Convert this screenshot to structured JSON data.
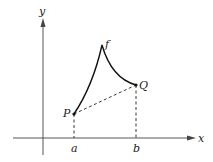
{
  "diagram": {
    "type": "function-curve-with-chord",
    "axes": {
      "x_label": "x",
      "y_label": "y"
    },
    "points": {
      "P": {
        "label": "P"
      },
      "Q": {
        "label": "Q"
      }
    },
    "curve_label": "f",
    "x_ticks": {
      "a": "a",
      "b": "b"
    },
    "colors": {
      "line": "#111111",
      "axis": "#444444",
      "background": "#ffffff"
    }
  }
}
